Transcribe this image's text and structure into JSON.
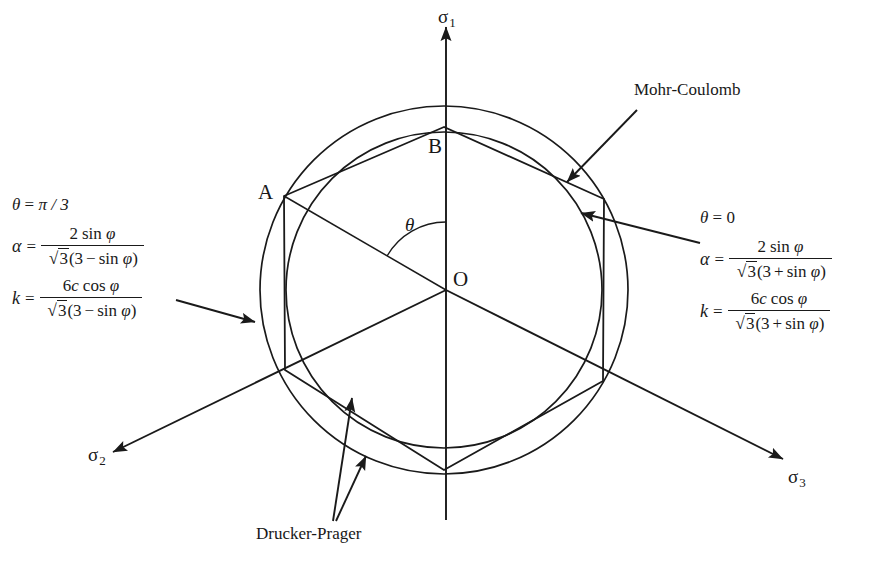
{
  "figure": {
    "title_implicit": "Mohr-Coulomb and Drucker-Prager yield surfaces on the deviatoric plane",
    "axes": [
      {
        "name": "sigma-1",
        "symbol": "σ",
        "subscript": "1"
      },
      {
        "name": "sigma-2",
        "symbol": "σ",
        "subscript": "2"
      },
      {
        "name": "sigma-3",
        "symbol": "σ",
        "subscript": "3"
      }
    ],
    "points": {
      "origin": "O",
      "vertex_a": "A",
      "vertex_b": "B"
    },
    "angle_label": "θ",
    "callouts": [
      {
        "name": "mohr-coulomb",
        "text": "Mohr-Coulomb"
      },
      {
        "name": "drucker-prager",
        "text": "Drucker-Prager"
      }
    ],
    "formulas": {
      "left": {
        "condition": "θ = π / 3",
        "condition_symbol": "θ",
        "condition_value": "π / 3",
        "alpha": {
          "lhs": "α",
          "numerator": "2 sin φ",
          "denominator": "√3(3 − sin φ)",
          "num_coeff": "2",
          "num_func": "sin",
          "num_var": "φ",
          "den_root": "3",
          "den_const": "3",
          "den_sign": "−",
          "den_func": "sin",
          "den_var": "φ"
        },
        "k": {
          "lhs": "k",
          "numerator": "6c cos φ",
          "denominator": "√3(3 − sin φ)",
          "num_coeff": "6",
          "num_c": "c",
          "num_func": "cos",
          "num_var": "φ",
          "den_root": "3",
          "den_const": "3",
          "den_sign": "−",
          "den_func": "sin",
          "den_var": "φ"
        }
      },
      "right": {
        "condition": "θ = 0",
        "condition_symbol": "θ",
        "condition_value": "0",
        "alpha": {
          "lhs": "α",
          "numerator": "2 sin φ",
          "denominator": "√3(3 + sin φ)",
          "num_coeff": "2",
          "num_func": "sin",
          "num_var": "φ",
          "den_root": "3",
          "den_const": "3",
          "den_sign": "+",
          "den_func": "sin",
          "den_var": "φ"
        },
        "k": {
          "lhs": "k",
          "numerator": "6c cos φ",
          "denominator": "√3(3 + sin φ)",
          "num_coeff": "6",
          "num_c": "c",
          "num_func": "cos",
          "num_var": "φ",
          "den_root": "3",
          "den_const": "3",
          "den_sign": "+",
          "den_func": "sin",
          "den_var": "φ"
        }
      }
    },
    "geometry": {
      "center_x": 444,
      "center_y": 290,
      "outer_circle_radius": 184,
      "inner_circle_radius": 158,
      "stroke_color": "#1a1a1a"
    }
  }
}
